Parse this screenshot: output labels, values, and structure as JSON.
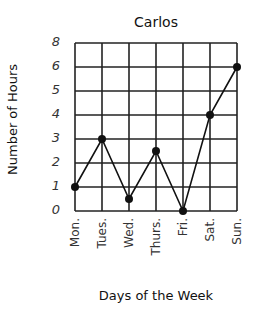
{
  "chart_data": {
    "type": "line",
    "title": "Carlos",
    "xlabel": "Days of the Week",
    "ylabel": "Number of Hours",
    "categories": [
      "Mon.",
      "Tues.",
      "Wed.",
      "Thurs.",
      "Fri.",
      "Sat.",
      "Sun."
    ],
    "values": [
      1,
      3,
      0.5,
      2.5,
      0,
      4,
      6
    ],
    "y_tick_labels": [
      "0",
      "1",
      "2",
      "3",
      "4",
      "5",
      "6",
      "8"
    ],
    "y_tick_note": "axis skips 7; gridline above 6 is labeled 8",
    "grid": true,
    "legend": null,
    "marker": "filled-circle",
    "line_color": "#111111"
  }
}
